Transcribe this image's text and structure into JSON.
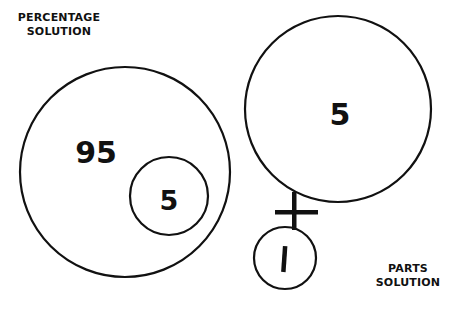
{
  "labels": {
    "percentage": [
      "PERCENTAGE",
      "SOLUTION"
    ],
    "parts": [
      "PARTS",
      "SOLUTION"
    ]
  },
  "percentage_diagram": {
    "outer_value": "95",
    "inner_value": "5"
  },
  "parts_diagram": {
    "top_value": "5",
    "operator": "+",
    "bottom_value": "1"
  },
  "colors": {
    "stroke": "#111111",
    "background": "#ffffff"
  }
}
